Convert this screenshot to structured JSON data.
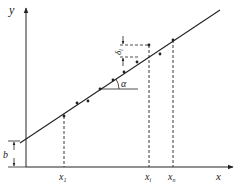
{
  "diagram": {
    "type": "linear regression illustration",
    "axes": {
      "x_label": "x",
      "y_label": "y"
    },
    "intercept_label": "b",
    "angle_label": "α",
    "deviation_label": "δ",
    "deviation_subscript": "i",
    "x_ticks": [
      {
        "main": "x",
        "sub": "1"
      },
      {
        "main": "x",
        "sub": "i"
      },
      {
        "main": "x",
        "sub": "n"
      }
    ],
    "colors": {
      "line": "#222222",
      "background": "#ffffff"
    }
  }
}
